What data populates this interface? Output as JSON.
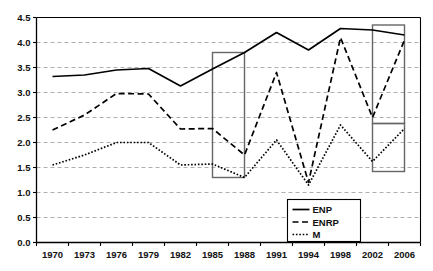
{
  "chart_data": {
    "type": "line",
    "title": "",
    "xlabel": "",
    "ylabel": "",
    "ylim": [
      0.0,
      4.5
    ],
    "ytick_step": 0.5,
    "grid": true,
    "legend_position": "bottom-center-right",
    "categories": [
      "1970",
      "1973",
      "1976",
      "1979",
      "1982",
      "1985",
      "1988",
      "1991",
      "1994",
      "1998",
      "2002",
      "2006"
    ],
    "ytick_labels": [
      "0.0",
      "0.5",
      "1.0",
      "1.5",
      "2.0",
      "2.5",
      "3.0",
      "3.5",
      "4.0",
      "4.5"
    ],
    "series": [
      {
        "name": "ENP",
        "style": "solid",
        "color": "#000000",
        "values": [
          3.32,
          3.35,
          3.45,
          3.48,
          3.13,
          3.47,
          3.8,
          4.2,
          3.85,
          4.28,
          4.25,
          4.15
        ]
      },
      {
        "name": "ENRP",
        "style": "dashed",
        "color": "#000000",
        "values": [
          2.25,
          2.55,
          2.98,
          2.97,
          2.27,
          2.28,
          1.75,
          3.4,
          1.2,
          4.1,
          2.5,
          4.05
        ]
      },
      {
        "name": "M",
        "style": "dotted",
        "color": "#000000",
        "values": [
          1.55,
          1.75,
          2.0,
          2.0,
          1.55,
          1.57,
          1.3,
          2.05,
          1.15,
          2.35,
          1.62,
          2.28
        ]
      }
    ],
    "annotations": [
      {
        "name": "highlight-box-1985-1988",
        "type": "rect",
        "x_from": "1985",
        "x_to": "1988",
        "y_from": 1.3,
        "y_to": 3.8,
        "stroke": "#666666"
      },
      {
        "name": "highlight-box-2002-2006-upper",
        "type": "rect",
        "x_from": "2002",
        "x_to": "2006",
        "y_from": 2.38,
        "y_to": 4.35,
        "stroke": "#666666"
      },
      {
        "name": "highlight-box-2002-2006-lower",
        "type": "rect",
        "x_from": "2002",
        "x_to": "2006",
        "y_from": 1.42,
        "y_to": 2.38,
        "stroke": "#666666"
      }
    ]
  },
  "legend": {
    "items": [
      {
        "label": "ENP"
      },
      {
        "label": "ENRP"
      },
      {
        "label": "M"
      }
    ]
  }
}
